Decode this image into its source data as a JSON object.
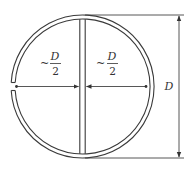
{
  "figure": {
    "labels": {
      "left_half": {
        "approx": "~",
        "numerator": "D",
        "denominator": "2"
      },
      "right_half": {
        "approx": "~",
        "numerator": "D",
        "denominator": "2"
      },
      "diameter": "D"
    },
    "colors": {
      "line": "#3a3a3a",
      "background": "#ffffff"
    }
  }
}
